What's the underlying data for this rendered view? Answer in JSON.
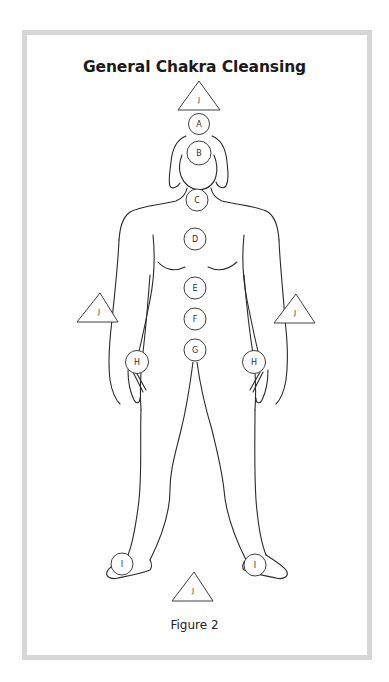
{
  "title": "General Chakra Cleansing",
  "caption": "Figure 2",
  "colors": {
    "line": "#2a2a2a",
    "frame": "#d6d6d6",
    "background": "#ffffff"
  },
  "chakra_points": [
    {
      "label": "A",
      "location": "crown"
    },
    {
      "label": "B",
      "location": "brow"
    },
    {
      "label": "C",
      "location": "throat"
    },
    {
      "label": "D",
      "location": "heart"
    },
    {
      "label": "E",
      "location": "solar-plexus"
    },
    {
      "label": "F",
      "location": "sacral"
    },
    {
      "label": "G",
      "location": "root"
    },
    {
      "label": "H",
      "location": "left-hand"
    },
    {
      "label": "H",
      "location": "right-hand"
    },
    {
      "label": "I",
      "location": "left-foot"
    },
    {
      "label": "I",
      "location": "right-foot"
    }
  ],
  "triangles": [
    {
      "label": "J",
      "location": "above-head"
    },
    {
      "label": "J",
      "location": "left-side"
    },
    {
      "label": "J",
      "location": "right-side"
    },
    {
      "label": "J",
      "location": "below-feet"
    }
  ]
}
